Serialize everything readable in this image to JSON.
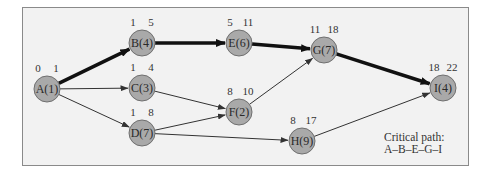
{
  "diagram": {
    "type": "activity-on-node network",
    "nodes": [
      {
        "id": "A",
        "label": "A(1)",
        "duration": 1,
        "es": 0,
        "ef": 1,
        "x": 47,
        "y": 89
      },
      {
        "id": "B",
        "label": "B(4)",
        "duration": 4,
        "es": 1,
        "ef": 5,
        "x": 142,
        "y": 43
      },
      {
        "id": "C",
        "label": "C(3)",
        "duration": 3,
        "es": 1,
        "ef": 4,
        "x": 142,
        "y": 88
      },
      {
        "id": "D",
        "label": "D(7)",
        "duration": 7,
        "es": 1,
        "ef": 8,
        "x": 142,
        "y": 133
      },
      {
        "id": "E",
        "label": "E(6)",
        "duration": 6,
        "es": 5,
        "ef": 11,
        "x": 239,
        "y": 43
      },
      {
        "id": "F",
        "label": "F(2)",
        "duration": 2,
        "es": 8,
        "ef": 10,
        "x": 239,
        "y": 112
      },
      {
        "id": "G",
        "label": "G(7)",
        "duration": 7,
        "es": 11,
        "ef": 18,
        "x": 324,
        "y": 50
      },
      {
        "id": "H",
        "label": "H(9)",
        "duration": 9,
        "es": 8,
        "ef": 17,
        "x": 302,
        "y": 141
      },
      {
        "id": "I",
        "label": "I(4)",
        "duration": 4,
        "es": 18,
        "ef": 22,
        "x": 443,
        "y": 88
      }
    ],
    "edges": [
      {
        "from": "A",
        "to": "B",
        "critical": true
      },
      {
        "from": "A",
        "to": "C",
        "critical": false
      },
      {
        "from": "A",
        "to": "D",
        "critical": false
      },
      {
        "from": "B",
        "to": "E",
        "critical": true
      },
      {
        "from": "C",
        "to": "F",
        "critical": false
      },
      {
        "from": "D",
        "to": "F",
        "critical": false
      },
      {
        "from": "D",
        "to": "H",
        "critical": false
      },
      {
        "from": "E",
        "to": "G",
        "critical": true
      },
      {
        "from": "F",
        "to": "G",
        "critical": false
      },
      {
        "from": "G",
        "to": "I",
        "critical": true
      },
      {
        "from": "H",
        "to": "I",
        "critical": false
      }
    ]
  },
  "legend": {
    "title": "Critical path:",
    "path": "A–B–E–G–I"
  },
  "colors": {
    "node_fill": "#a9a9a9",
    "node_stroke": "#6f6f6f",
    "edge": "#333333",
    "critical_edge": "#111111",
    "background": "#f2f2f2"
  }
}
